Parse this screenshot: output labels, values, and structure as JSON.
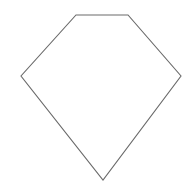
{
  "canvas": {
    "width": 193,
    "height": 192,
    "background_color": "#ffffff",
    "title": "Pentagon outline diagram"
  },
  "figure": {
    "name": "pentagon",
    "fill_color": "none",
    "fill_label": "white",
    "stroke_color": "#6a6a6a",
    "stroke_width": 1.1,
    "stroke_linejoin": "miter",
    "vertex_count": 5,
    "points": "76,15 128,15 181,76 103,180 21,76",
    "vertices": [
      {
        "label": "top-left",
        "x": 76,
        "y": 15
      },
      {
        "label": "top-right",
        "x": 128,
        "y": 15
      },
      {
        "label": "right",
        "x": 181,
        "y": 76
      },
      {
        "label": "bottom",
        "x": 103,
        "y": 180
      },
      {
        "label": "left",
        "x": 21,
        "y": 76
      }
    ]
  }
}
